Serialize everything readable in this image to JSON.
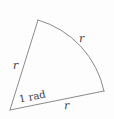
{
  "figure": {
    "type": "geometry-diagram",
    "shape": "circular-sector",
    "colors": {
      "background": "#fdfdfd",
      "stroke": "#8a8a8a",
      "text": "#3a3a3a"
    },
    "geometry": {
      "center": {
        "x": 10,
        "y": 110
      },
      "radius": 96,
      "arc_start": {
        "x": 38,
        "y": 20
      },
      "arc_end": {
        "x": 104,
        "y": 91
      },
      "central_angle_radians": 1,
      "stroke_width": 1
    },
    "labels": {
      "radius_left": "r",
      "radius_arc": "r",
      "radius_bottom": "r",
      "angle": "1 rad"
    }
  }
}
